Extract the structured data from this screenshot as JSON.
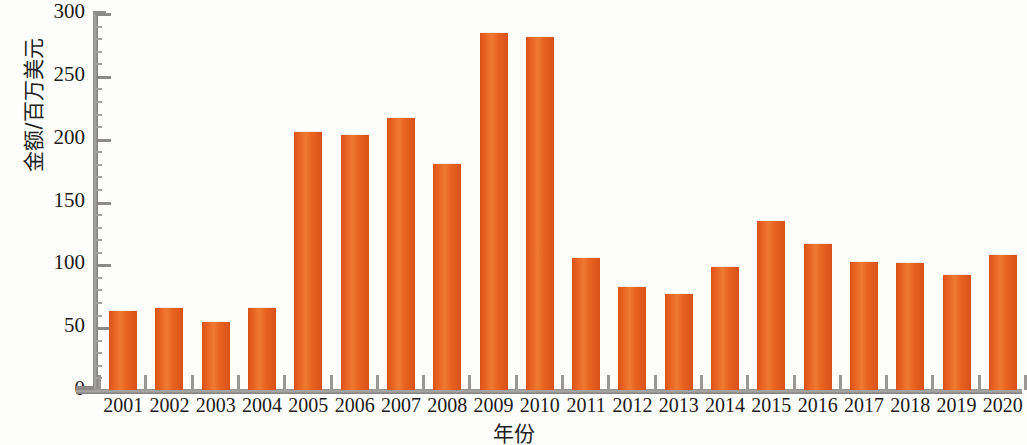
{
  "chart_data": {
    "type": "bar",
    "title": "",
    "xlabel": "年份",
    "ylabel": "金额/百万美元",
    "categories": [
      "2001",
      "2002",
      "2003",
      "2004",
      "2005",
      "2006",
      "2007",
      "2008",
      "2009",
      "2010",
      "2011",
      "2012",
      "2013",
      "2014",
      "2015",
      "2016",
      "2017",
      "2018",
      "2019",
      "2020"
    ],
    "values": [
      64,
      66,
      55,
      66,
      206,
      204,
      217,
      181,
      285,
      282,
      106,
      83,
      77,
      99,
      135,
      117,
      103,
      102,
      92,
      108
    ],
    "series": [
      {
        "name": "金额/百万美元",
        "values": [
          64,
          66,
          55,
          66,
          206,
          204,
          217,
          181,
          285,
          282,
          106,
          83,
          77,
          99,
          135,
          117,
          103,
          102,
          92,
          108
        ]
      }
    ],
    "ylim": [
      0,
      300
    ],
    "ytick_values": [
      0,
      50,
      100,
      150,
      200,
      250,
      300
    ],
    "ytick_labels": [
      "0",
      "50",
      "100",
      "150",
      "200",
      "250",
      "300"
    ],
    "grid": false,
    "legend": false,
    "legend_position": "none",
    "bar_color": "#e4601e",
    "axis_color": "#8e8d8b",
    "text_color": "#1d1a19",
    "background": "#ffffff"
  }
}
